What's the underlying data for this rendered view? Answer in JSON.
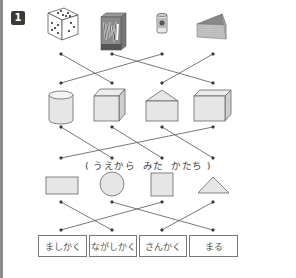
{
  "problem_number": "1",
  "rows": {
    "objects": [
      {
        "id": "dice",
        "label": "dice-icon"
      },
      {
        "id": "tissue-box",
        "label": "tissue-box-icon"
      },
      {
        "id": "can",
        "label": "can-icon"
      },
      {
        "id": "cheese-wedge",
        "label": "triangular-prism-icon"
      }
    ],
    "solids": [
      {
        "id": "cylinder",
        "label": "cylinder-icon"
      },
      {
        "id": "cube",
        "label": "cube-icon"
      },
      {
        "id": "pentagonal-prism",
        "label": "house-prism-icon"
      },
      {
        "id": "cuboid",
        "label": "cuboid-icon"
      }
    ],
    "top_view_shapes": [
      {
        "id": "rectangle",
        "label": "rectangle-icon"
      },
      {
        "id": "circle",
        "label": "circle-icon"
      },
      {
        "id": "square",
        "label": "square-icon"
      },
      {
        "id": "triangle",
        "label": "triangle-icon"
      }
    ],
    "names": [
      "ましかく",
      "ながしかく",
      "さんかく",
      "まる"
    ]
  },
  "caption": {
    "open_paren": "(",
    "word1": "うえから",
    "word2": "みた",
    "word3": "かたち",
    "close_paren": ")"
  },
  "connections": {
    "objects_to_solids": [
      [
        0,
        1
      ],
      [
        1,
        3
      ],
      [
        2,
        0
      ],
      [
        3,
        2
      ]
    ],
    "solids_to_shapes": [
      [
        0,
        1
      ],
      [
        1,
        2
      ],
      [
        2,
        3
      ],
      [
        3,
        0
      ]
    ],
    "shapes_to_names": [
      [
        0,
        1
      ],
      [
        1,
        3
      ],
      [
        2,
        0
      ],
      [
        3,
        2
      ]
    ]
  },
  "colors": {
    "line": "#555555",
    "shape_fill": "#e6e6e6",
    "shape_stroke": "#666666",
    "badge": "#3a3a3a"
  }
}
